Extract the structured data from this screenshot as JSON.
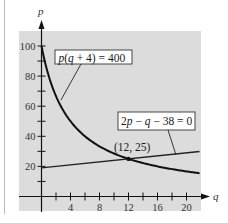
{
  "chart_data": {
    "type": "line",
    "title": "",
    "xlabel": "q",
    "ylabel": "p",
    "xlim": [
      0,
      22
    ],
    "ylim": [
      0,
      105
    ],
    "x_ticks": [
      2,
      4,
      6,
      8,
      10,
      12,
      14,
      16,
      18,
      20
    ],
    "x_tick_labels": [
      "4",
      "8",
      "12",
      "16",
      "20"
    ],
    "x_tick_label_values": [
      4,
      8,
      12,
      16,
      20
    ],
    "y_ticks": [
      10,
      20,
      30,
      40,
      50,
      60,
      70,
      80,
      90,
      100
    ],
    "y_tick_labels": [
      "20",
      "40",
      "60",
      "80",
      "100"
    ],
    "y_tick_label_values": [
      20,
      40,
      60,
      80,
      100
    ],
    "grid": false,
    "background": "#dcdcdc",
    "series": [
      {
        "name": "p(q + 4) = 400",
        "kind": "demand curve",
        "equation": "p = 400/(q+4)",
        "x": [
          0,
          1,
          2,
          3,
          4,
          6,
          8,
          10,
          12,
          14,
          16,
          18,
          20,
          21.8
        ],
        "y": [
          100,
          80,
          66.7,
          57.1,
          50,
          40,
          33.3,
          28.6,
          25,
          22.2,
          20,
          18.2,
          16.7,
          15.5
        ],
        "color": "#111111"
      },
      {
        "name": "2p − q − 38 = 0",
        "kind": "supply line",
        "equation": "p = (q+38)/2",
        "x": [
          0,
          21.8
        ],
        "y": [
          19,
          29.9
        ],
        "color": "#222222"
      }
    ],
    "annotations": [
      {
        "text": "p(q + 4) = 400",
        "points_to": "demand curve"
      },
      {
        "text": "2p − q − 38 = 0",
        "points_to": "supply line"
      },
      {
        "text": "(12, 25)",
        "x": 12,
        "y": 25,
        "kind": "intersection point"
      }
    ]
  },
  "labels": {
    "x_axis": "q",
    "y_axis": "p",
    "demand_eq": {
      "p": "p",
      "open": "(",
      "q": "q",
      "rest": " + 4) = 400"
    },
    "supply_eq": {
      "a": "2",
      "p": "p",
      "m1": " − ",
      "q": "q",
      "rest": " − 38 = 0"
    },
    "intersection": "(12, 25)"
  }
}
